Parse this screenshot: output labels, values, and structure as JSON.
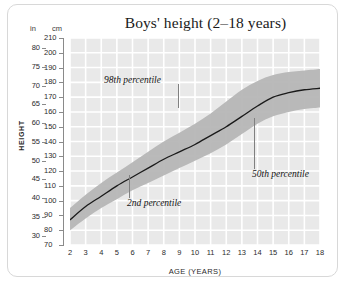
{
  "chart_data": {
    "type": "line",
    "title": "Boys' height (2–18 years)",
    "xlabel": "AGE (YEARS)",
    "ylabel": "HEIGHT",
    "unit_primary_label": "cm",
    "unit_secondary_label": "in",
    "grid": true,
    "legend": "none",
    "xlim": [
      2,
      18
    ],
    "ylim_cm": [
      70,
      210
    ],
    "ylim_in": [
      27.6,
      82.7
    ],
    "x_ticks": [
      2,
      3,
      4,
      5,
      6,
      7,
      8,
      9,
      10,
      11,
      12,
      13,
      14,
      15,
      16,
      17,
      18
    ],
    "y_ticks_cm": [
      70,
      80,
      90,
      100,
      110,
      120,
      130,
      140,
      150,
      160,
      170,
      180,
      190,
      200,
      210
    ],
    "y_ticks_in": [
      30,
      35,
      40,
      45,
      50,
      55,
      60,
      65,
      70,
      75,
      80
    ],
    "x": [
      2,
      3,
      4,
      5,
      6,
      7,
      8,
      9,
      10,
      11,
      12,
      13,
      14,
      15,
      16,
      17,
      18
    ],
    "series": [
      {
        "name": "50th percentile",
        "units": "cm",
        "values": [
          87,
          96,
          103,
          110,
          116,
          122,
          128,
          133,
          138,
          144,
          150,
          157,
          164,
          170,
          173,
          175,
          176
        ]
      },
      {
        "name": "98th percentile",
        "units": "cm",
        "values": [
          95,
          104,
          112,
          119,
          126,
          133,
          140,
          146,
          152,
          159,
          167,
          175,
          181,
          185,
          187,
          188,
          189
        ]
      },
      {
        "name": "2nd percentile",
        "units": "cm",
        "values": [
          80,
          88,
          95,
          101,
          107,
          112,
          117,
          122,
          127,
          132,
          138,
          145,
          152,
          157,
          160,
          162,
          163
        ]
      }
    ],
    "band_description": "Shaded band between 2nd and 98th percentile",
    "annotations": [
      {
        "text": "98th percentile",
        "points_to_series": "98th percentile",
        "age": 8.6
      },
      {
        "text": "2nd percentile",
        "points_to_series": "2nd percentile",
        "age": 6.0
      },
      {
        "text": "50th percentile",
        "points_to_series": "50th percentile",
        "age": 13.0
      }
    ]
  },
  "colors": {
    "plot_background": "#e9e9e9",
    "gridline": "#ffffff",
    "band_fill": "#b4b4b4",
    "median_line": "#1a1a1a",
    "axis": "#8a8a8a",
    "card_border": "#d8d8d8",
    "text": "#1a1a1a"
  }
}
